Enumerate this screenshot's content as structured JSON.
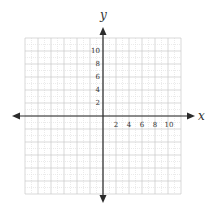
{
  "chart_data": {
    "type": "coordinate-plane",
    "title": "",
    "xlabel": "x",
    "ylabel": "y",
    "xlim": [
      -12,
      12
    ],
    "ylim": [
      -12,
      12
    ],
    "grid": true,
    "grid_major_step": 2,
    "grid_minor_step": 1,
    "x_ticks": [
      "2",
      "4",
      "6",
      "8",
      "10"
    ],
    "y_ticks": [
      "2",
      "4",
      "6",
      "8",
      "10"
    ],
    "series": []
  },
  "axes": {
    "x_label": "x",
    "y_label": "y",
    "x_tick_labels": [
      "2",
      "4",
      "6",
      "8",
      "10"
    ],
    "y_tick_labels": [
      "2",
      "4",
      "6",
      "8",
      "10"
    ]
  },
  "colors": {
    "axis": "#2b2b2b",
    "grid_major": "#c8c8c8",
    "grid_minor": "#e2e2e2",
    "text": "#333333"
  }
}
